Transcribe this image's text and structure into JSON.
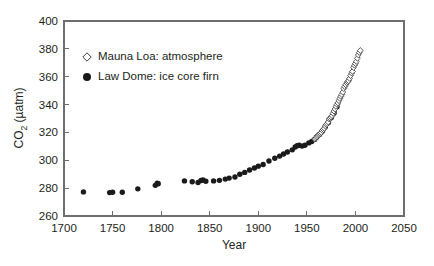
{
  "figure": {
    "background": "#ffffff",
    "frame_color": "#6d6e70",
    "text_color": "#231f20"
  },
  "axis_titles": {
    "x": "Year",
    "y_main": "CO",
    "y_sub": "2",
    "y_units": " (µatm)"
  },
  "legend": {
    "items": [
      {
        "label": "Mauna Loa: atmosphere",
        "marker": "open-diamond",
        "color": "#ffffff",
        "edge": "#3b3b3b"
      },
      {
        "label": "Law Dome: ice core firn",
        "marker": "filled-circle",
        "color": "#1a1a1a",
        "edge": "#1a1a1a"
      }
    ]
  },
  "chart_data": {
    "type": "scatter",
    "title": "",
    "xlabel": "Year",
    "ylabel": "CO2 (µatm)",
    "xlim": [
      1700,
      2050
    ],
    "ylim": [
      260,
      400
    ],
    "xticks": [
      1700,
      1750,
      1800,
      1850,
      1900,
      1950,
      2000,
      2050
    ],
    "yticks": [
      260,
      280,
      300,
      320,
      340,
      360,
      380,
      400
    ],
    "grid": false,
    "legend_position": "upper-left-inside",
    "series": [
      {
        "name": "Law Dome: ice core firn",
        "marker": "filled-circle",
        "color": "#1a1a1a",
        "points": [
          [
            1720,
            277.3
          ],
          [
            1747,
            276.8
          ],
          [
            1750,
            277.0
          ],
          [
            1760,
            277.0
          ],
          [
            1776,
            279.5
          ],
          [
            1794,
            282.0
          ],
          [
            1796,
            283.6
          ],
          [
            1797,
            283.2
          ],
          [
            1824,
            285.2
          ],
          [
            1832,
            284.6
          ],
          [
            1838,
            284.0
          ],
          [
            1841,
            285.5
          ],
          [
            1843,
            285.8
          ],
          [
            1846,
            285.0
          ],
          [
            1854,
            285.2
          ],
          [
            1860,
            285.6
          ],
          [
            1866,
            286.5
          ],
          [
            1870,
            287.2
          ],
          [
            1876,
            288.0
          ],
          [
            1881,
            290.0
          ],
          [
            1886,
            291.3
          ],
          [
            1891,
            293.0
          ],
          [
            1896,
            294.5
          ],
          [
            1900,
            295.8
          ],
          [
            1905,
            297.0
          ],
          [
            1911,
            299.5
          ],
          [
            1917,
            301.5
          ],
          [
            1922,
            303.0
          ],
          [
            1926,
            304.5
          ],
          [
            1930,
            306.0
          ],
          [
            1935,
            307.5
          ],
          [
            1938,
            309.5
          ],
          [
            1940,
            310.5
          ],
          [
            1942,
            310.8
          ],
          [
            1945,
            310.2
          ],
          [
            1948,
            310.8
          ],
          [
            1952,
            312.5
          ],
          [
            1955,
            313.5
          ],
          [
            1958,
            315.0
          ],
          [
            1960,
            316.5
          ],
          [
            1963,
            318.5
          ],
          [
            1966,
            321.0
          ],
          [
            1969,
            324.0
          ],
          [
            1972,
            327.0
          ],
          [
            1975,
            330.5
          ],
          [
            1978,
            334.0
          ],
          [
            1981,
            338.5
          ]
        ]
      },
      {
        "name": "Mauna Loa: atmosphere",
        "marker": "open-diamond",
        "color": "#ffffff",
        "points": [
          [
            1958,
            315.2
          ],
          [
            1959,
            315.9
          ],
          [
            1960,
            316.7
          ],
          [
            1961,
            317.4
          ],
          [
            1962,
            318.1
          ],
          [
            1963,
            318.7
          ],
          [
            1964,
            319.3
          ],
          [
            1965,
            320.0
          ],
          [
            1966,
            321.3
          ],
          [
            1967,
            322.1
          ],
          [
            1968,
            323.0
          ],
          [
            1969,
            324.6
          ],
          [
            1970,
            325.6
          ],
          [
            1971,
            326.3
          ],
          [
            1972,
            327.4
          ],
          [
            1973,
            329.6
          ],
          [
            1974,
            330.1
          ],
          [
            1975,
            331.0
          ],
          [
            1976,
            332.0
          ],
          [
            1977,
            333.7
          ],
          [
            1978,
            335.3
          ],
          [
            1979,
            336.8
          ],
          [
            1980,
            338.6
          ],
          [
            1981,
            340.1
          ],
          [
            1982,
            341.2
          ],
          [
            1983,
            342.8
          ],
          [
            1984,
            344.4
          ],
          [
            1985,
            345.9
          ],
          [
            1986,
            347.2
          ],
          [
            1987,
            348.9
          ],
          [
            1988,
            351.5
          ],
          [
            1989,
            352.9
          ],
          [
            1990,
            354.2
          ],
          [
            1991,
            355.6
          ],
          [
            1992,
            356.4
          ],
          [
            1993,
            357.1
          ],
          [
            1994,
            358.8
          ],
          [
            1995,
            360.8
          ],
          [
            1996,
            362.6
          ],
          [
            1997,
            363.8
          ],
          [
            1998,
            366.6
          ],
          [
            1999,
            368.3
          ],
          [
            2000,
            369.5
          ],
          [
            2001,
            371.0
          ],
          [
            2002,
            373.2
          ],
          [
            2003,
            375.6
          ],
          [
            2004,
            377.4
          ],
          [
            2005,
            378.8
          ]
        ]
      }
    ]
  },
  "geometry": {
    "plot_left": 64,
    "plot_right": 404,
    "plot_top": 21,
    "plot_bottom": 216
  }
}
